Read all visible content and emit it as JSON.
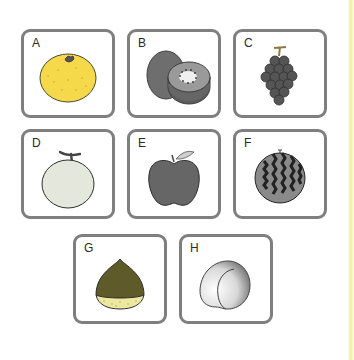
{
  "cards": [
    {
      "letter": "A",
      "fruit": "orange",
      "icon": "orange-icon",
      "color": "#f5d94a"
    },
    {
      "letter": "B",
      "fruit": "kiwi",
      "icon": "kiwi-icon",
      "color": "#6e6e6e"
    },
    {
      "letter": "C",
      "fruit": "grapes",
      "icon": "grapes-icon",
      "color": "#555555"
    },
    {
      "letter": "D",
      "fruit": "melon",
      "icon": "melon-icon",
      "color": "#e4e8dc"
    },
    {
      "letter": "E",
      "fruit": "apple",
      "icon": "apple-icon",
      "color": "#666666"
    },
    {
      "letter": "F",
      "fruit": "watermelon",
      "icon": "watermelon-icon",
      "color": "#3e3e3e"
    },
    {
      "letter": "G",
      "fruit": "chestnut",
      "icon": "chestnut-icon",
      "color": "#5e5a2a"
    },
    {
      "letter": "H",
      "fruit": "peach",
      "icon": "peach-icon",
      "color": "#d8d8d8"
    }
  ]
}
